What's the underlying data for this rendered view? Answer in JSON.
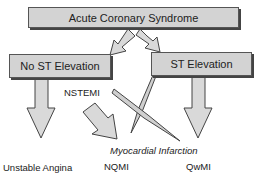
{
  "nodes": {
    "root": "Acute Coronary Syndrome",
    "no_st": "No ST Elevation",
    "st": "ST Elevation"
  },
  "labels": {
    "nstemi": "NSTEMI",
    "mi": "Myocardial Infarction",
    "unstable_angina": "Unstable Angina",
    "nqmi": "NQMI",
    "qwmi": "QwMI"
  },
  "colors": {
    "box_fill": "#d3d3d3",
    "arrow_fill": "#d9d9d9",
    "stroke": "#444444"
  }
}
